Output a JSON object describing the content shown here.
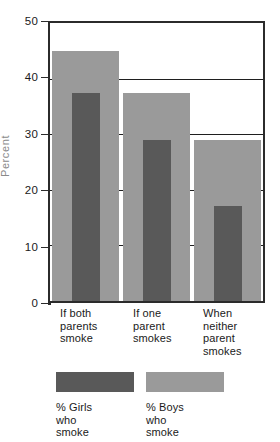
{
  "chart_data": {
    "type": "bar",
    "title": "",
    "xlabel": "",
    "ylabel": "Percent",
    "ylim": [
      0,
      50
    ],
    "yticks": [
      0,
      10,
      20,
      30,
      40,
      50
    ],
    "grid": "horizontal",
    "legend_position": "bottom",
    "categories": [
      "If both parents smoke",
      "If one parent smokes",
      "When neither parent smokes"
    ],
    "category_lines": [
      [
        "If both",
        "parents",
        "smoke"
      ],
      [
        "If one",
        "parent",
        "smokes"
      ],
      [
        "When",
        "neither",
        "parent",
        "smokes"
      ]
    ],
    "series": [
      {
        "name": "% Girls who smoke",
        "values": [
          37.5,
          29,
          17
        ],
        "color": "#595959"
      },
      {
        "name": "% Boys who smoke",
        "values": [
          45,
          37.5,
          29
        ],
        "color": "#9a9a9a"
      }
    ]
  },
  "axis": {
    "y_title": "Percent",
    "ticks": [
      {
        "label": "50",
        "value": 50
      },
      {
        "label": "40",
        "value": 40
      },
      {
        "label": "30",
        "value": 30
      },
      {
        "label": "20",
        "value": 20
      },
      {
        "label": "10",
        "value": 10
      },
      {
        "label": "0",
        "value": 0
      }
    ]
  },
  "categories": [
    {
      "line1": "If both",
      "line2": "parents",
      "line3": "smoke",
      "line4": ""
    },
    {
      "line1": "If one",
      "line2": "parent",
      "line3": "smokes",
      "line4": ""
    },
    {
      "line1": "When",
      "line2": "neither",
      "line3": "parent",
      "line4": "smokes"
    }
  ],
  "legend": {
    "entries": [
      {
        "line1": "% Girls",
        "line2": "who",
        "line3": "smoke",
        "color": "#595959"
      },
      {
        "line1": "% Boys",
        "line2": "who",
        "line3": "smoke",
        "color": "#9a9a9a"
      }
    ]
  },
  "colors": {
    "girls": "#595959",
    "boys": "#9a9a9a",
    "axis": "#2b2b2b",
    "grid": "#1f1f1f",
    "background": "#ffffff",
    "axis_title": "#8a8a8a"
  }
}
